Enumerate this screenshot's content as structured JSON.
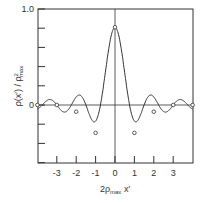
{
  "chart_data": {
    "type": "line",
    "title": "",
    "xlabel": "2ρ_max x'",
    "ylabel": "ρ(x') / ρ²_max",
    "xlim": [
      -4,
      4
    ],
    "ylim": [
      -0.6,
      1.0
    ],
    "x_ticks": [
      -3,
      -2,
      -1,
      0,
      1,
      2,
      3
    ],
    "y_tick_labels": [
      "1.0",
      "0"
    ],
    "grid": false,
    "series": [
      {
        "name": "ρ(x')/ρ²max",
        "x": [
          -4,
          -3.5,
          -3,
          -2.5,
          -2,
          -1.3,
          -1,
          -0.75,
          0,
          0.75,
          1,
          1.3,
          2,
          2.5,
          3,
          3.5,
          4
        ],
        "values": [
          0,
          -0.12,
          0,
          0.14,
          -0.07,
          -0.44,
          -0.29,
          0,
          0.81,
          0,
          -0.29,
          -0.44,
          -0.07,
          0.14,
          0,
          -0.12,
          0
        ]
      }
    ],
    "markers_x": [
      -4,
      -3,
      -2,
      -1,
      0,
      1,
      2,
      3,
      4
    ],
    "markers_y": [
      0,
      0,
      -0.07,
      -0.29,
      0.81,
      -0.29,
      -0.07,
      0,
      0
    ]
  }
}
